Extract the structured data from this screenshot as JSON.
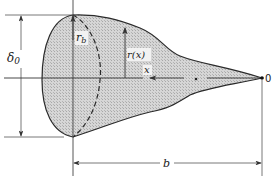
{
  "diagram": {
    "labels": {
      "delta": "δ",
      "delta_sub": "0",
      "r_b": "r",
      "r_b_sub": "b",
      "r_x": "r(x)",
      "x": "x",
      "origin": "0",
      "b": "b"
    },
    "colors": {
      "fill": "#cfcfcf",
      "stroke": "#2a2a2a",
      "line": "#555555"
    }
  }
}
